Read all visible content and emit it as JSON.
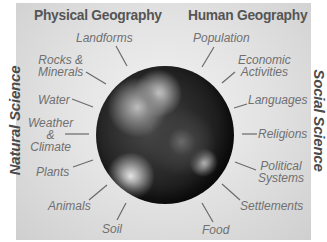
{
  "headings": {
    "left": "Physical Geography",
    "right": "Human Geography"
  },
  "side_labels": {
    "left": "Natural Science",
    "right": "Social Science"
  },
  "center": {
    "image": "earth-globe"
  },
  "physical_topics": [
    {
      "label": "Landforms"
    },
    {
      "label": "Rocks &",
      "label2": "Minerals"
    },
    {
      "label": "Water"
    },
    {
      "label": "Weather",
      "label2": "&",
      "label3": "Climate"
    },
    {
      "label": "Plants"
    },
    {
      "label": "Animals"
    },
    {
      "label": "Soil"
    }
  ],
  "human_topics": [
    {
      "label": "Population"
    },
    {
      "label": "Economic",
      "label2": "Activities"
    },
    {
      "label": "Languages"
    },
    {
      "label": "Religions"
    },
    {
      "label": "Political",
      "label2": "Systems"
    },
    {
      "label": "Settlements"
    },
    {
      "label": "Food"
    }
  ],
  "colors": {
    "panel": "#e4e4e4",
    "heading": "#555555",
    "label": "#707070",
    "line": "#6a6a6a"
  }
}
